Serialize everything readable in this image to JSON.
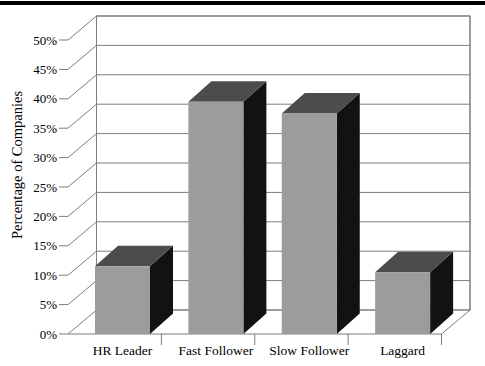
{
  "page": {
    "background": "#ffffff",
    "top_band": {
      "color": "#000000",
      "height_px": 3.5
    }
  },
  "chart_data": {
    "type": "bar",
    "style": "3d-column",
    "title": "",
    "xlabel": "",
    "ylabel": "Percentage of Companies",
    "categories": [
      "HR Leader",
      "Fast Follower",
      "Slow Follower",
      "Laggard"
    ],
    "values": [
      11,
      39,
      37,
      10
    ],
    "unit": "%",
    "ylim": [
      0,
      50
    ],
    "ytick_step": 5,
    "ytick_labels": [
      "0%",
      "5%",
      "10%",
      "15%",
      "20%",
      "25%",
      "30%",
      "35%",
      "40%",
      "45%",
      "50%"
    ],
    "grid": true,
    "legend": false,
    "colors": {
      "bar_front": "#9c9c9c",
      "bar_top": "#4c4c4c",
      "bar_side": "#121212",
      "line": "#7d7d7d",
      "wall_fill": "#ffffff",
      "text": "#000000"
    }
  }
}
